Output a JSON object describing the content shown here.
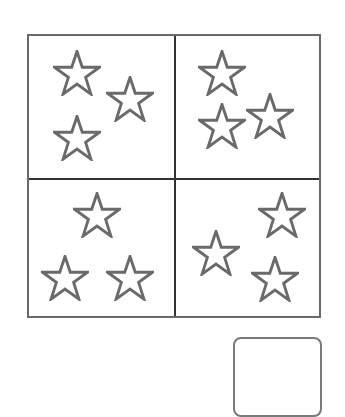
{
  "worksheet": {
    "quadrants": [
      {
        "id": "top-left",
        "star_count": 3,
        "stars": [
          {
            "x": 53,
            "y": 50
          },
          {
            "x": 106,
            "y": 76
          },
          {
            "x": 53,
            "y": 115
          }
        ]
      },
      {
        "id": "top-right",
        "star_count": 3,
        "stars": [
          {
            "x": 198,
            "y": 50
          },
          {
            "x": 246,
            "y": 93
          },
          {
            "x": 198,
            "y": 103
          }
        ]
      },
      {
        "id": "bottom-left",
        "star_count": 3,
        "stars": [
          {
            "x": 73,
            "y": 192
          },
          {
            "x": 41,
            "y": 255
          },
          {
            "x": 106,
            "y": 255
          }
        ]
      },
      {
        "id": "bottom-right",
        "star_count": 3,
        "stars": [
          {
            "x": 258,
            "y": 192
          },
          {
            "x": 192,
            "y": 230
          },
          {
            "x": 251,
            "y": 256
          }
        ]
      }
    ],
    "answer_box": {
      "value": ""
    },
    "colors": {
      "stroke": "#6a6a6a",
      "divider": "#333333"
    }
  }
}
